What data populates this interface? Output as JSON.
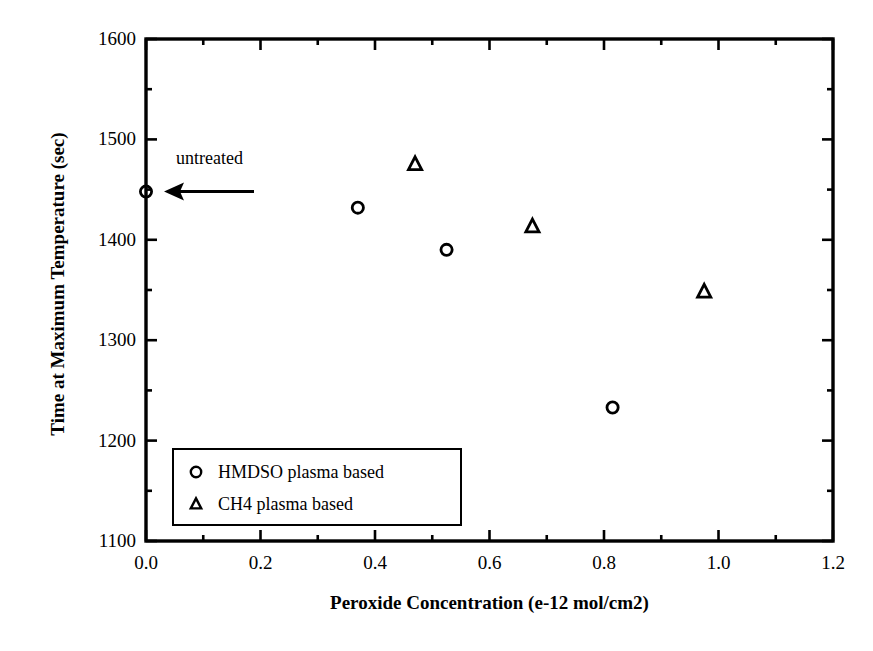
{
  "chart_data": {
    "type": "scatter",
    "title": "",
    "xlabel": "Peroxide Concentration (e-12 mol/cm2)",
    "ylabel": "Time at Maximum Temperature (sec)",
    "xlim": [
      0.0,
      1.2
    ],
    "ylim": [
      1100,
      1600
    ],
    "xticks": [
      "0.0",
      "0.2",
      "0.4",
      "0.6",
      "0.8",
      "1.0",
      "1.2"
    ],
    "xtick_values": [
      0.0,
      0.2,
      0.4,
      0.6,
      0.8,
      1.0,
      1.2
    ],
    "xminor_step": 0.1,
    "yticks": [
      "1100",
      "1200",
      "1300",
      "1400",
      "1500",
      "1600"
    ],
    "ytick_values": [
      1100,
      1200,
      1300,
      1400,
      1500,
      1600
    ],
    "yminor_step": 50,
    "grid": false,
    "legend_position": "lower left",
    "series": [
      {
        "name": "HMDSO plasma based",
        "marker": "circle",
        "points": [
          {
            "x": 0.0,
            "y": 1448
          },
          {
            "x": 0.37,
            "y": 1432
          },
          {
            "x": 0.525,
            "y": 1390
          },
          {
            "x": 0.815,
            "y": 1233
          }
        ]
      },
      {
        "name": "CH4 plasma based",
        "marker": "triangle",
        "points": [
          {
            "x": 0.47,
            "y": 1475
          },
          {
            "x": 0.675,
            "y": 1413
          },
          {
            "x": 0.975,
            "y": 1348
          }
        ]
      }
    ],
    "annotations": [
      {
        "text": "untreated",
        "target_x": 0.0,
        "target_y": 1448,
        "arrow": "left"
      }
    ]
  },
  "legend": {
    "entries": [
      {
        "label": "HMDSO plasma based",
        "marker": "circle"
      },
      {
        "label": "CH4 plasma based",
        "marker": "triangle"
      }
    ]
  },
  "colors": {
    "axis": "#000000",
    "marker": "#000000",
    "background": "#ffffff"
  }
}
